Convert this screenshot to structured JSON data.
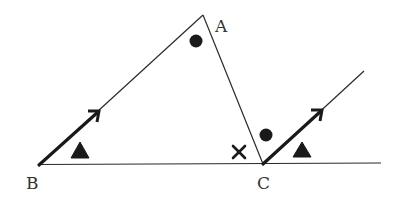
{
  "diagram": {
    "type": "geometry-triangle-parallel-lines",
    "colors": {
      "line": "#2a2a2a",
      "marks": "#1a1a1a",
      "label": "#333333",
      "background": "#ffffff"
    },
    "points": {
      "A": {
        "label": "A",
        "x": 203,
        "y": 15
      },
      "B": {
        "label": "B",
        "x": 39,
        "y": 165
      },
      "C": {
        "label": "C",
        "x": 263,
        "y": 164
      }
    },
    "segments": [
      {
        "name": "BA",
        "from": "B",
        "to": "A"
      },
      {
        "name": "AC",
        "from": "A",
        "to": "C"
      },
      {
        "name": "BC-extended",
        "from": "B",
        "to_xy": [
          381,
          163
        ]
      },
      {
        "name": "C-ray-parallel-to-BA",
        "from": "C",
        "to_xy": [
          364,
          71
        ]
      }
    ],
    "parallel_arrows": [
      {
        "on": "BA",
        "from": [
          39,
          165
        ],
        "to": [
          99,
          111
        ]
      },
      {
        "on": "C-ray",
        "from": [
          263,
          164
        ],
        "to": [
          322,
          110
        ]
      }
    ],
    "angle_marks": [
      {
        "symbol": "dot",
        "at_vertex": "A",
        "x": 196,
        "y": 41
      },
      {
        "symbol": "dot",
        "at_vertex": "C",
        "x": 266,
        "y": 135,
        "note": "between CA and ray"
      },
      {
        "symbol": "cross",
        "at_vertex": "C",
        "x": 239,
        "y": 152,
        "note": "interior angle ACB"
      },
      {
        "symbol": "triangle",
        "at_vertex": "B",
        "x": 80,
        "y": 151
      },
      {
        "symbol": "triangle",
        "at_vertex": "C",
        "x": 302,
        "y": 150,
        "note": "between ray and extended BC"
      }
    ]
  }
}
